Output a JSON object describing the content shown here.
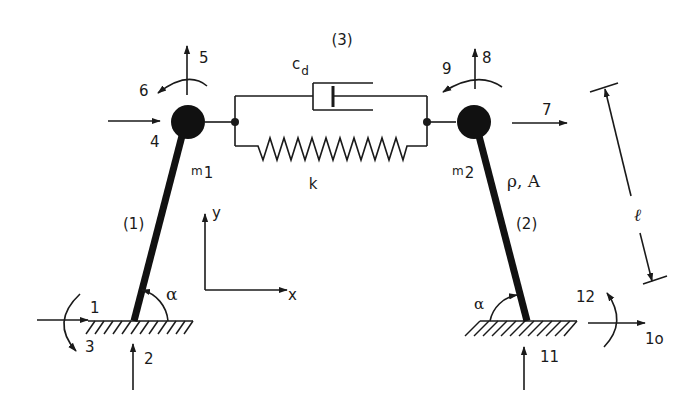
{
  "diagram": {
    "members": [
      {
        "id": "member-1",
        "label": "(1)"
      },
      {
        "id": "member-2",
        "label": "(2)"
      },
      {
        "id": "member-3",
        "label": "(3)"
      }
    ],
    "masses": [
      {
        "id": "mass-1",
        "symbol": "m",
        "subscript": "1"
      },
      {
        "id": "mass-2",
        "symbol": "m",
        "subscript": "2"
      }
    ],
    "damper": {
      "symbol": "c",
      "subscript": "d"
    },
    "spring": {
      "symbol": "k"
    },
    "bar_properties": "ρ, A",
    "length_label": "ℓ",
    "angle_label": "α",
    "axes": {
      "x": "x",
      "y": "y"
    },
    "dofs": {
      "d1": "1",
      "d2": "2",
      "d3": "3",
      "d4": "4",
      "d5": "5",
      "d6": "6",
      "d7": "7",
      "d8": "8",
      "d9": "9",
      "d10": "1o",
      "d11": "11",
      "d12": "12"
    },
    "colors": {
      "ink": "#1a1a1a",
      "background": "#ffffff"
    }
  }
}
